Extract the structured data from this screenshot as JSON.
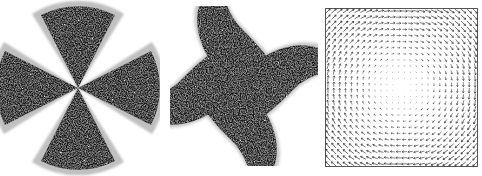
{
  "figure": {
    "background_color": "#ffffff",
    "width": 482,
    "height": 176,
    "panel_count": 3
  },
  "panels": [
    {
      "id": "panel-radial",
      "name": "radial-lobe-pattern",
      "label": "",
      "type": "polar-intensity-map",
      "description": "Four-lobed straight-edged radial pattern (cross / maltese shape) converging at a central point",
      "has_border": false,
      "background_color": "#ffffff",
      "foreground_color": "#111111",
      "edge_shading_color": "#999999",
      "lobe_count": 4,
      "lobe_half_angle_deg": 27,
      "lobe_orientations_deg": [
        90,
        0,
        270,
        180
      ],
      "center": {
        "x": 78,
        "y": 88
      },
      "radius": 82,
      "texture": "dithered-speckle"
    },
    {
      "id": "panel-spiral",
      "name": "spiral-pinwheel-pattern",
      "label": "",
      "type": "polar-intensity-map",
      "description": "Four curved spiral arms (pinwheel) converging at a central point, arms sweep counter-clockwise",
      "has_border": false,
      "background_color": "#ffffff",
      "foreground_color": "#111111",
      "edge_shading_color": "#999999",
      "arm_count": 4,
      "arm_sweep_deg": 95,
      "arm_half_angle_deg": 26,
      "center": {
        "x": 77,
        "y": 85
      },
      "radius": 86,
      "texture": "dithered-speckle"
    },
    {
      "id": "panel-quiver",
      "name": "vector-field-quiver-plot",
      "label": "",
      "type": "quiver",
      "description": "Grid of small arrows showing a rotational (vortex) vector field; magnitude grows toward the edges and vanishes near the centre",
      "has_border": true,
      "border_color": "#555555",
      "background_color": "#ffffff",
      "arrow_color": "#333333",
      "grid_columns": 26,
      "grid_rows": 26,
      "plot_box": {
        "x": 5,
        "y": 8,
        "width": 153,
        "height": 159
      },
      "field": "rotational",
      "rotation_sense": "counter-clockwise",
      "center": {
        "x": 81,
        "y": 87
      },
      "max_arrow_length": 6.5
    }
  ],
  "chart_data": [
    {
      "type": "heatmap",
      "title": "Four-lobed radial intensity pattern",
      "xlabel": "",
      "ylabel": "",
      "grid": false,
      "legend_position": "none",
      "description": "Intensity ~ binary threshold of cos(2*theta); four straight wedges at 0, 90, 180, 270 degrees",
      "categories": [
        "lobe-up",
        "lobe-right",
        "lobe-down",
        "lobe-left"
      ],
      "values": [
        1,
        1,
        1,
        1
      ],
      "angles_deg": [
        90,
        0,
        270,
        180
      ],
      "lobe_half_angle_deg": 27,
      "radius": 82
    },
    {
      "type": "heatmap",
      "title": "Four-arm spiral pinwheel intensity pattern",
      "xlabel": "",
      "ylabel": "",
      "grid": false,
      "legend_position": "none",
      "description": "Intensity ~ binary threshold of cos(2*theta - k*r); four arms spiral outward counter-clockwise",
      "categories": [
        "arm-1",
        "arm-2",
        "arm-3",
        "arm-4"
      ],
      "values": [
        1,
        1,
        1,
        1
      ],
      "start_angles_deg": [
        70,
        160,
        250,
        340
      ],
      "arm_sweep_deg": 95,
      "radius": 86
    },
    {
      "type": "scatter",
      "title": "Rotational vector field (quiver)",
      "xlabel": "",
      "ylabel": "",
      "grid": false,
      "legend_position": "none",
      "description": "u = -(y-yc)*f(r), v = (x-xc)*f(r); arrow length increases with distance from centre",
      "xlim": [
        -1,
        1
      ],
      "ylim": [
        -1,
        1
      ],
      "grid_columns": 26,
      "grid_rows": 26,
      "series": [
        {
          "name": "vector-field",
          "values": [
            1
          ]
        }
      ]
    }
  ]
}
